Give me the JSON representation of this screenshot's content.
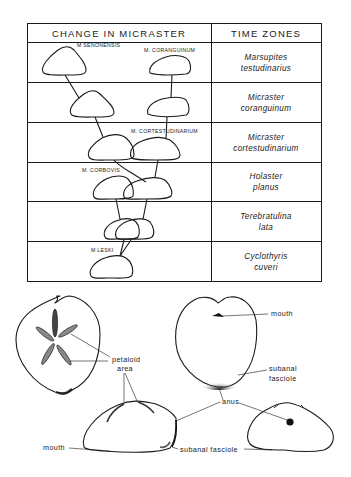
{
  "table": {
    "header_left": "CHANGE IN MICRASTER",
    "header_right": "TIME ZONES",
    "rows": [
      {
        "zone_line1": "Marsupites",
        "zone_line2": "testudinarius"
      },
      {
        "zone_line1": "Micraster",
        "zone_line2": "coranguinum"
      },
      {
        "zone_line1": "Micraster",
        "zone_line2": "cortestudinarium"
      },
      {
        "zone_line1": "Holaster",
        "zone_line2": "planus"
      },
      {
        "zone_line1": "Terebratulina",
        "zone_line2": "lata"
      },
      {
        "zone_line1": "Cyclothyris",
        "zone_line2": "cuveri"
      }
    ],
    "species_labels": {
      "senonensis": "M SENONENSIS",
      "coranguinum": "M. CORANGUINUM",
      "cortestudinarium": "M. CORTESTUDINARIUM",
      "corbovis": "M. CORBOVIS",
      "leski": "M LESKI"
    }
  },
  "anatomy": {
    "labels": {
      "petaloid_line1": "petaloid",
      "petaloid_line2": "area",
      "mouth_top": "mouth",
      "subanal_line1": "subanal",
      "subanal_line2": "fasciole",
      "anus": "anus",
      "mouth_side": "mouth",
      "subanal_fasciole": "subanal fasciole"
    }
  }
}
